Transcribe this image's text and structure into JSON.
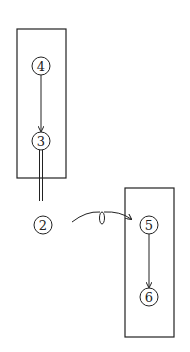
{
  "diagram": {
    "nodes": [
      {
        "id": "n4",
        "label": "4",
        "cx": 41,
        "cy": 66
      },
      {
        "id": "n3",
        "label": "3",
        "cx": 41,
        "cy": 141
      },
      {
        "id": "n2",
        "label": "2",
        "cx": 43,
        "cy": 225
      },
      {
        "id": "n5",
        "label": "5",
        "cx": 149,
        "cy": 225
      },
      {
        "id": "n6",
        "label": "6",
        "cx": 149,
        "cy": 297
      }
    ],
    "groups": [
      {
        "id": "left-box",
        "members": [
          "4",
          "3"
        ]
      },
      {
        "id": "right-box",
        "members": [
          "5",
          "6"
        ]
      }
    ],
    "edges": [
      {
        "from": "4",
        "to": "3",
        "type": "arrow"
      },
      {
        "from": "3",
        "to": "2",
        "type": "double-line"
      },
      {
        "from": "2",
        "to": "5",
        "type": "curved-loop-arrow"
      },
      {
        "from": "5",
        "to": "6",
        "type": "arrow"
      }
    ],
    "stroke_color": "#222222"
  }
}
